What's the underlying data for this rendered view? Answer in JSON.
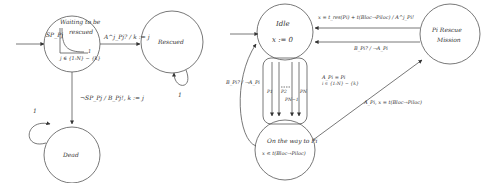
{
  "left_diagram": {
    "states": {
      "waiting": {
        "name": "Waiting to be rescued",
        "line1": "Waiting to be",
        "line2": "rescued",
        "self_label": "SP_Pj",
        "set_label": "j ∈ {1:N} − {k}",
        "inner_value": "1"
      },
      "rescued": {
        "name": "Rescued",
        "self_loop_label": "1"
      },
      "dead": {
        "name": "Dead",
        "self_loop_label": "1"
      }
    },
    "transitions": {
      "waiting_to_rescued": "A^j_Pj? / k := j",
      "waiting_to_dead": "¬SP_Pj  / B_Pj!, k := j"
    }
  },
  "right_diagram": {
    "states": {
      "idle": {
        "name": "Idle",
        "invariant": "x := 0"
      },
      "on_the_way": {
        "name": "On the way to Pi",
        "invariant": "x ≤ t(Bloc→Piloc)"
      },
      "rescue_mission": {
        "name": "Pi Rescue Mission",
        "line1": "Pi  Rescue",
        "line2": "Mission"
      }
    },
    "transitions": {
      "rescue_to_idle_top": "x = t_res(Pi) + t(Bloc→Piloc) / A^j_Pi!",
      "rescue_to_idle_bottom": "B_Pi? / ¬A_Pi",
      "idle_branch_guard": "A_Pi = Pi",
      "idle_branch_set": "i ∈ {1:N} − {k}",
      "on_the_way_to_idle": "B_Pi? / ¬A_Pi",
      "on_the_way_to_rescue": "A_Pi, x = t(Bloc→Piloc)"
    },
    "branches": [
      "P1",
      "P2",
      "PN−1",
      "PN"
    ]
  }
}
